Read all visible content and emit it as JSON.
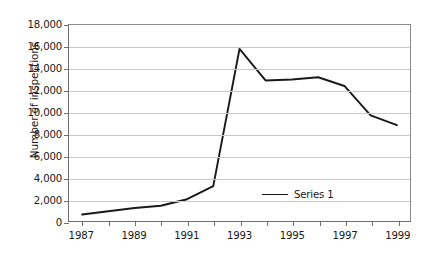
{
  "chart_data": {
    "type": "line",
    "title": "",
    "xlabel": "",
    "ylabel": "Number of inspections",
    "x": [
      1987,
      1988,
      1989,
      1990,
      1991,
      1992,
      1993,
      1994,
      1995,
      1996,
      1997,
      1998,
      1999
    ],
    "xlim": [
      1986.5,
      1999.5
    ],
    "ylim": [
      0,
      18000
    ],
    "ytick_values": [
      0,
      2000,
      4000,
      6000,
      8000,
      10000,
      12000,
      14000,
      16000,
      18000
    ],
    "ytick_labels": [
      "0",
      "2,000",
      "4,000",
      "6,000",
      "8,000",
      "10,000",
      "12,000",
      "14,000",
      "16,000",
      "18,000"
    ],
    "xtick_values": [
      1987,
      1988,
      1989,
      1990,
      1991,
      1992,
      1993,
      1994,
      1995,
      1996,
      1997,
      1998,
      1999
    ],
    "xtick_labels": [
      "1987",
      "",
      "1989",
      "",
      "1991",
      "",
      "1993",
      "",
      "1995",
      "",
      "1997",
      "",
      "1999"
    ],
    "grid": "horizontal",
    "legend_position": "inside-bottom-right",
    "series": [
      {
        "name": "Series 1",
        "color": "#1a1a1a",
        "values": [
          600,
          900,
          1200,
          1400,
          2000,
          3200,
          15800,
          12900,
          13000,
          13200,
          12400,
          9700,
          8800
        ]
      }
    ]
  },
  "legend": {
    "entries": [
      {
        "label": "Series 1",
        "color": "#1a1a1a"
      }
    ]
  },
  "axis": {
    "y_title": "Number of inspections"
  }
}
